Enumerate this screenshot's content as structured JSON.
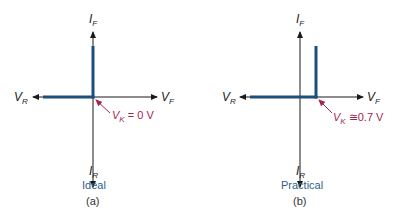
{
  "colors": {
    "axis": "#1a1a1a",
    "characteristic": "#1e4e7a",
    "knee_label": "#a3264e",
    "caption_label": "#2f5f8a"
  },
  "panels": [
    {
      "id": "a",
      "title": "Ideal",
      "caption": "(a)",
      "axes": {
        "up": {
          "symbol": "I",
          "sub": "F"
        },
        "down": {
          "symbol": "I",
          "sub": "R"
        },
        "left": {
          "symbol": "V",
          "sub": "R"
        },
        "right": {
          "symbol": "V",
          "sub": "F"
        }
      },
      "knee": {
        "symbol": "V",
        "sub": "K",
        "relation": "=",
        "value": "0 V"
      }
    },
    {
      "id": "b",
      "title": "Practical",
      "caption": "(b)",
      "axes": {
        "up": {
          "symbol": "I",
          "sub": "F"
        },
        "down": {
          "symbol": "I",
          "sub": "R"
        },
        "left": {
          "symbol": "V",
          "sub": "R"
        },
        "right": {
          "symbol": "V",
          "sub": "F"
        }
      },
      "knee": {
        "symbol": "V",
        "sub": "K",
        "relation": "≅",
        "value": "0.7 V"
      }
    }
  ]
}
